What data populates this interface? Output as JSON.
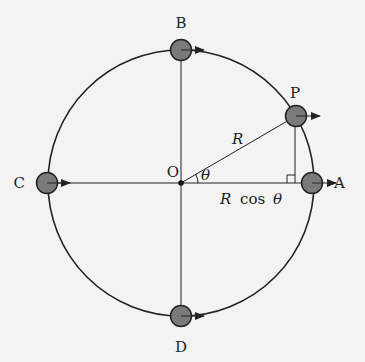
{
  "diagram": {
    "type": "circular-motion-projection",
    "colors": {
      "background": "#f3f3f3",
      "line": "#222222",
      "ball_fill": "#7a7a7a",
      "ball_stroke": "#222222"
    },
    "circle": {
      "cx": 181,
      "cy": 183,
      "r": 133
    },
    "center_label": "O",
    "angle_label": "θ",
    "radius_label": "R",
    "projection_label": "R cos θ",
    "projection_label_parts": {
      "R": "R",
      "cos": "cos",
      "theta": "θ"
    },
    "points": [
      {
        "id": "A",
        "label": "A",
        "x": 312,
        "y": 183,
        "lx": 334,
        "ly": 188
      },
      {
        "id": "B",
        "label": "B",
        "x": 181,
        "y": 50,
        "lx": 181,
        "ly": 24
      },
      {
        "id": "C",
        "label": "C",
        "x": 47,
        "y": 183,
        "lx": 24,
        "ly": 188
      },
      {
        "id": "D",
        "label": "D",
        "x": 181,
        "y": 316,
        "lx": 181,
        "ly": 350
      },
      {
        "id": "P",
        "label": "P",
        "x": 296,
        "y": 116,
        "lx": 295,
        "ly": 94
      }
    ]
  }
}
